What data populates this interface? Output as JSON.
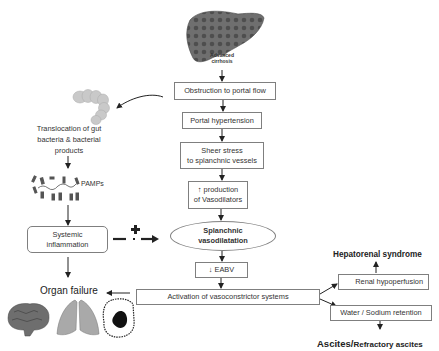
{
  "diagram": {
    "liver": {
      "caption_line1": "Advanced",
      "caption_line2": "cirrhosis"
    },
    "main_chain": [
      {
        "id": "obstruction",
        "text": "Obstruction to portal flow"
      },
      {
        "id": "portal_hypertension",
        "text": "Portal hypertension"
      },
      {
        "id": "sheer_stress",
        "line1": "Sheer stress",
        "line2": "to splanchnic vessels"
      },
      {
        "id": "vasodilators",
        "line1": "↑ production",
        "line2": "of Vasodilators"
      },
      {
        "id": "splanchnic",
        "line1": "Splanchnic",
        "line2": "vasodilatation"
      },
      {
        "id": "eabv",
        "text": "↓ EABV"
      },
      {
        "id": "activation",
        "text": "Activation of vasoconstrictor systems"
      }
    ],
    "left_branch": {
      "translocation_line1": "Translocation of gut",
      "translocation_line2": "bacteria & bacterial",
      "translocation_line3": "products",
      "pamps": "PAMPs",
      "inflammation_line1": "Systemic",
      "inflammation_line2": "inflammation",
      "plus_sign": "+",
      "organ_failure": "Organ failure"
    },
    "right_branch": {
      "renal": "Renal hypoperfusion",
      "hepatorenal": "Hepatorenal syndrome",
      "water_sodium": "Water / Sodium retention",
      "ascites_a": "Ascites/",
      "ascites_b": "Refractory ascites"
    },
    "icons": [
      "liver-image",
      "colon-image",
      "bacteria-image",
      "brain-image",
      "lungs-image",
      "heart-image"
    ]
  }
}
